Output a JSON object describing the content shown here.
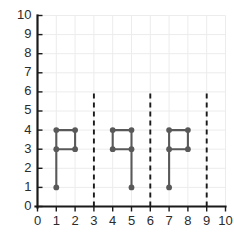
{
  "chart_data": {
    "type": "line",
    "title": "",
    "subtitle": "",
    "xlabel": "",
    "ylabel": "",
    "xlim": [
      0,
      10
    ],
    "ylim": [
      0,
      10
    ],
    "xticks": [
      0,
      1,
      2,
      3,
      4,
      5,
      6,
      7,
      8,
      9,
      10
    ],
    "yticks": [
      0,
      1,
      2,
      3,
      4,
      5,
      6,
      7,
      8,
      9,
      10
    ],
    "xtick_labels": [
      "0",
      "1",
      "2",
      "3",
      "4",
      "5",
      "6",
      "7",
      "8",
      "9",
      "10"
    ],
    "ytick_labels": [
      "0",
      "1",
      "2",
      "3",
      "4",
      "5",
      "6",
      "7",
      "8",
      "9",
      "10"
    ],
    "grid": true,
    "legend": false,
    "legend_position": "none",
    "annotations": [],
    "colors": {
      "series": "#595959",
      "marker": "#595959",
      "axis": "#1a1a1a",
      "grid": "#ececec",
      "divider": "#1a1a1a",
      "background": "#ffffff",
      "tick_text": "#2b2b2b"
    },
    "series": [
      {
        "name": "shape-1",
        "points": [
          [
            1,
            1
          ],
          [
            1,
            3
          ],
          [
            1,
            4
          ],
          [
            2,
            4
          ],
          [
            2,
            3
          ],
          [
            1,
            3
          ]
        ],
        "markers": [
          [
            1,
            1
          ],
          [
            1,
            3
          ],
          [
            1,
            4
          ],
          [
            2,
            4
          ],
          [
            2,
            3
          ]
        ]
      },
      {
        "name": "shape-2",
        "points": [
          [
            5,
            1
          ],
          [
            5,
            3
          ],
          [
            4,
            3
          ],
          [
            4,
            4
          ],
          [
            5,
            4
          ],
          [
            5,
            3
          ]
        ],
        "markers": [
          [
            5,
            1
          ],
          [
            5,
            3
          ],
          [
            4,
            3
          ],
          [
            4,
            4
          ],
          [
            5,
            4
          ]
        ]
      },
      {
        "name": "shape-3",
        "points": [
          [
            7,
            1
          ],
          [
            7,
            3
          ],
          [
            7,
            4
          ],
          [
            8,
            4
          ],
          [
            8,
            3
          ],
          [
            7,
            3
          ]
        ],
        "markers": [
          [
            7,
            1
          ],
          [
            7,
            3
          ],
          [
            7,
            4
          ],
          [
            8,
            4
          ],
          [
            8,
            3
          ]
        ]
      }
    ],
    "dividers": [
      {
        "name": "divider-x3",
        "x": 3,
        "y_start": 0,
        "y_end": 6
      },
      {
        "name": "divider-x6",
        "x": 6,
        "y_start": 0,
        "y_end": 6
      },
      {
        "name": "divider-x9",
        "x": 9,
        "y_start": 0,
        "y_end": 6
      }
    ]
  }
}
